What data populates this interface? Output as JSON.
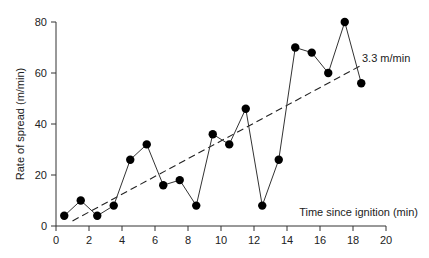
{
  "chart_data": {
    "type": "line",
    "title": "",
    "xlabel": "Time since ignition (min)",
    "ylabel": "Rate of spread (m/min)",
    "xlim": [
      0,
      20
    ],
    "ylim": [
      0,
      80
    ],
    "xticks": [
      0,
      2,
      4,
      6,
      8,
      10,
      12,
      14,
      16,
      18,
      20
    ],
    "yticks": [
      0,
      20,
      40,
      60,
      80
    ],
    "grid": false,
    "legend": null,
    "series": [
      {
        "name": "Observed rate of spread",
        "style": "solid line with filled circle markers",
        "x": [
          0.5,
          1.5,
          2.5,
          3.5,
          4.5,
          5.5,
          6.5,
          7.5,
          8.5,
          9.5,
          10.5,
          11.5,
          12.5,
          13.5,
          14.5,
          15.5,
          16.5,
          17.5,
          18.5
        ],
        "values": [
          4,
          10,
          4,
          8,
          26,
          32,
          16,
          18,
          8,
          36,
          32,
          46,
          8,
          26,
          70,
          68,
          60,
          80,
          56
        ]
      },
      {
        "name": "Linear trend",
        "style": "dashed line",
        "x": [
          1,
          18.5
        ],
        "values": [
          2,
          63
        ]
      }
    ],
    "annotations": [
      {
        "text": "3.3 m/min",
        "x": 18.6,
        "y": 65
      }
    ]
  },
  "labels": {
    "xlabel": "Time since ignition (min)",
    "ylabel": "Rate of spread (m/min)",
    "trend_annotation": "3.3 m/min"
  }
}
